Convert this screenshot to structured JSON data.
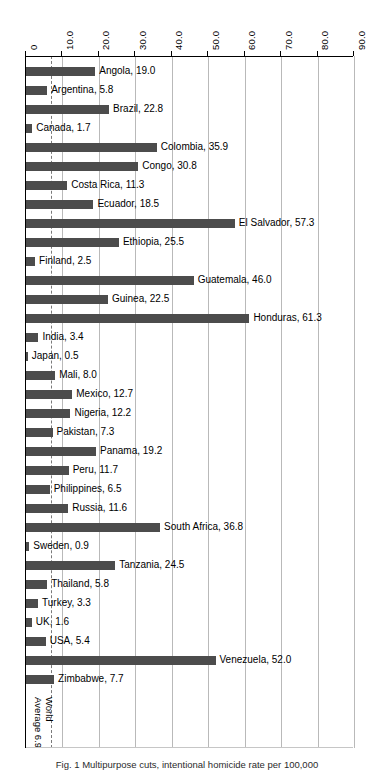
{
  "chart_data": {
    "type": "bar",
    "orientation": "horizontal",
    "title": "",
    "xlabel": "",
    "ylabel": "",
    "xlim": [
      0,
      90
    ],
    "grid": true,
    "legend": null,
    "axis_position": "top",
    "tick_labels": [
      "0",
      "10.0",
      "20.0",
      "30.0",
      "40.0",
      "50.0",
      "60.0",
      "70.0",
      "80.0",
      "90.0"
    ],
    "tick_values": [
      0,
      10,
      20,
      30,
      40,
      50,
      60,
      70,
      80,
      90
    ],
    "bar_color": "#4c4c4c",
    "gridline_color": "#b9b9b9",
    "reference_line": {
      "value": 6.9,
      "label_lines": [
        "World",
        "Average 6.9"
      ],
      "style": "dashed",
      "color": "#7a7a7a"
    },
    "categories": [
      "Angola",
      "Argentina",
      "Brazil",
      "Canada",
      "Colombia",
      "Congo",
      "Costa Rica",
      "Ecuador",
      "El Salvador",
      "Ethiopia",
      "Finland",
      "Guatemala",
      "Guinea",
      "Honduras",
      "India",
      "Japan",
      "Mali",
      "Mexico",
      "Nigeria",
      "Pakistan",
      "Panama",
      "Peru",
      "Philippines",
      "Russia",
      "South Africa",
      "Sweden",
      "Tanzania",
      "Thailand",
      "Turkey",
      "UK",
      "USA",
      "Venezuela",
      "Zimbabwe"
    ],
    "values": [
      19.0,
      5.8,
      22.8,
      1.7,
      35.9,
      30.8,
      11.3,
      18.5,
      57.3,
      25.5,
      2.5,
      46.0,
      22.5,
      61.3,
      3.4,
      0.5,
      8.0,
      12.7,
      12.2,
      7.3,
      19.2,
      11.7,
      6.5,
      11.6,
      36.8,
      0.9,
      24.5,
      5.8,
      3.3,
      1.6,
      5.4,
      52.0,
      7.7
    ],
    "data_labels": [
      "Angola, 19.0",
      "Argentina, 5.8",
      "Brazil, 22.8",
      "Canada, 1.7",
      "Colombia, 35.9",
      "Congo, 30.8",
      "Costa Rica, 11.3",
      "Ecuador, 18.5",
      "El Salvador, 57.3",
      "Ethiopia, 25.5",
      "Finland, 2.5",
      "Guatemala, 46.0",
      "Guinea, 22.5",
      "Honduras, 61.3",
      "India, 3.4",
      "Japan, 0.5",
      "Mali, 8.0",
      "Mexico, 12.7",
      "Nigeria, 12.2",
      "Pakistan, 7.3",
      "Panama, 19.2",
      "Peru, 11.7",
      "Philippines, 6.5",
      "Russia, 11.6",
      "South Africa, 36.8",
      "Sweden, 0.9",
      "Tanzania, 24.5",
      "Thailand, 5.8",
      "Turkey, 3.3",
      "UK, 1.6",
      "USA, 5.4",
      "Venezuela, 52.0",
      "Zimbabwe, 7.7"
    ]
  },
  "caption": "Fig. 1  Multipurpose cuts, intentional homicide rate per 100,000"
}
